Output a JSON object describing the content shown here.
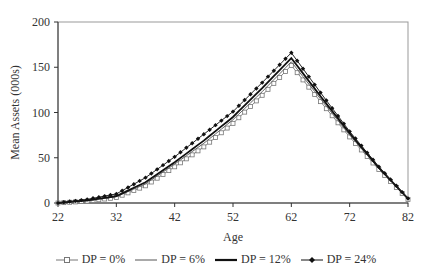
{
  "chart_data": {
    "type": "line",
    "title": "",
    "xlabel": "Age",
    "ylabel": "Mean Assets (000s)",
    "xlim": [
      22,
      82
    ],
    "ylim": [
      0,
      200
    ],
    "xticks": [
      22,
      32,
      42,
      52,
      62,
      72,
      82
    ],
    "yticks": [
      0,
      50,
      100,
      150,
      200
    ],
    "grid": false,
    "legend_position": "bottom",
    "x": [
      22,
      27,
      32,
      37,
      42,
      47,
      52,
      57,
      62,
      67,
      72,
      77,
      82
    ],
    "series": [
      {
        "name": "DP = 0%",
        "marker": "open-square",
        "line": "thin-gray",
        "color": "#777777",
        "values": [
          0,
          2,
          6,
          19,
          40,
          62,
          88,
          119,
          152,
          112,
          73,
          37,
          4
        ]
      },
      {
        "name": "DP = 6%",
        "marker": "none",
        "line": "thin",
        "color": "#555555",
        "values": [
          0,
          2.5,
          7,
          21,
          43,
          66,
          92,
          123,
          156,
          115,
          75,
          38,
          4
        ]
      },
      {
        "name": "DP = 12%",
        "marker": "none",
        "line": "thick",
        "color": "#111111",
        "values": [
          0,
          3,
          7.5,
          23,
          45,
          69,
          95,
          127,
          160,
          118,
          77,
          39,
          5
        ]
      },
      {
        "name": "DP = 24%",
        "marker": "filled-diamond",
        "line": "thin-black",
        "color": "#111111",
        "values": [
          0,
          4,
          10,
          28,
          51,
          76,
          101,
          133,
          166,
          122,
          79,
          40,
          5
        ]
      }
    ]
  }
}
